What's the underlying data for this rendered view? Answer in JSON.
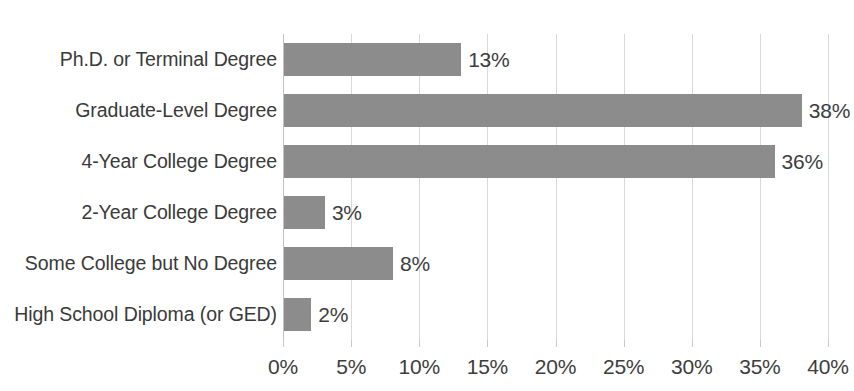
{
  "chart_data": {
    "type": "bar",
    "orientation": "horizontal",
    "title": "",
    "subtitle": "",
    "xlabel": "",
    "ylabel": "",
    "xlim": [
      0,
      40
    ],
    "xtick_step": 5,
    "grid": true,
    "legend": false,
    "categories": [
      "Ph.D. or Terminal Degree",
      "Graduate-Level Degree",
      "4-Year College Degree",
      "2-Year College Degree",
      "Some College but No Degree",
      "High School Diploma (or GED)"
    ],
    "values": [
      13,
      38,
      36,
      3,
      8,
      2
    ],
    "value_labels": [
      "13%",
      "38%",
      "36%",
      "3%",
      "8%",
      "2%"
    ],
    "xtick_labels": [
      "0%",
      "5%",
      "10%",
      "15%",
      "20%",
      "25%",
      "30%",
      "35%",
      "40%"
    ],
    "xtick_values": [
      0,
      5,
      10,
      15,
      20,
      25,
      30,
      35,
      40
    ],
    "colors": {
      "bar": "#8c8c8c",
      "background": "#ffffff",
      "gridline": "#d9d9d9",
      "axis": "#c2c2c2",
      "text": "#3a3a3a"
    }
  }
}
